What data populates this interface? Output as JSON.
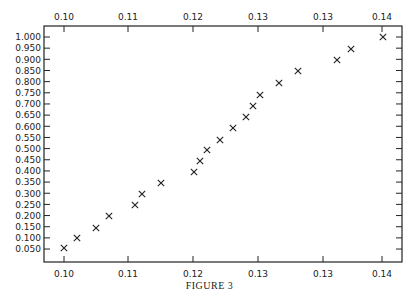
{
  "figure": {
    "caption": "FIGURE 3"
  },
  "chart_data": {
    "type": "scatter",
    "title": "",
    "caption": "FIGURE 3",
    "xlabel": "",
    "ylabel": "",
    "marker": "x",
    "grid": false,
    "legend": null,
    "x_tick_labels_top": [
      "0.10",
      "0.11",
      "0.12",
      "0.13",
      "0.13",
      "0.14"
    ],
    "x_tick_labels_bottom": [
      "0.10",
      "0.11",
      "0.12",
      "0.13",
      "0.13",
      "0.14"
    ],
    "y_tick_labels": [
      "1.000",
      "0.950",
      "0.900",
      "0.850",
      "0.800",
      "0.750",
      "0.700",
      "0.650",
      "0.600",
      "0.550",
      "0.500",
      "0.450",
      "0.400",
      "0.350",
      "0.300",
      "0.250",
      "0.200",
      "0.150",
      "0.100",
      "0.050"
    ],
    "ylim": [
      0.0,
      1.05
    ],
    "xlim": [
      0.097,
      0.152
    ],
    "x": [
      0.1,
      0.102,
      0.105,
      0.107,
      0.111,
      0.112,
      0.115,
      0.12,
      0.121,
      0.122,
      0.124,
      0.126,
      0.128,
      0.129,
      0.13,
      0.133,
      0.136,
      0.142,
      0.144,
      0.149
    ],
    "y": [
      0.05,
      0.1,
      0.15,
      0.2,
      0.25,
      0.3,
      0.35,
      0.4,
      0.45,
      0.5,
      0.55,
      0.6,
      0.65,
      0.7,
      0.75,
      0.8,
      0.85,
      0.9,
      0.95,
      1.0
    ]
  },
  "layout": {
    "frame": {
      "left": 44,
      "top": 26,
      "right": 402,
      "bottom": 262
    },
    "x_tick_px": [
      64,
      128,
      193,
      258,
      323,
      382
    ],
    "y_tick_top_px": 37,
    "y_tick_spacing_px": 11.16,
    "point_px": [
      [
        64,
        248
      ],
      [
        77,
        238
      ],
      [
        96,
        228
      ],
      [
        109,
        216
      ],
      [
        135,
        205
      ],
      [
        142,
        194
      ],
      [
        161,
        183
      ],
      [
        194,
        172
      ],
      [
        200,
        161
      ],
      [
        207,
        150
      ],
      [
        220,
        140
      ],
      [
        233,
        128
      ],
      [
        246,
        117
      ],
      [
        253,
        106
      ],
      [
        260,
        95
      ],
      [
        279,
        83
      ],
      [
        298,
        71
      ],
      [
        337,
        60
      ],
      [
        351,
        49
      ],
      [
        383,
        37
      ]
    ]
  }
}
